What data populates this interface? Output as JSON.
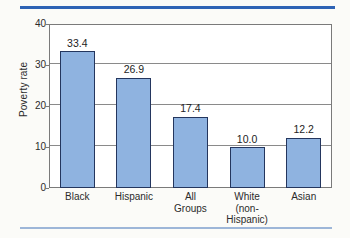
{
  "decor": {
    "top_rule_color": "#2e63b5",
    "bottom_rule_color": "#9db6d8"
  },
  "chart_data": {
    "type": "bar",
    "title": "",
    "xlabel": "",
    "ylabel": "Poverty rate",
    "categories": [
      "Black",
      "Hispanic",
      "All Groups",
      "White (non-Hispanic)",
      "Asian"
    ],
    "category_lines": [
      [
        "Black"
      ],
      [
        "Hispanic"
      ],
      [
        "All",
        "Groups"
      ],
      [
        "White",
        "(non-",
        "Hispanic)"
      ],
      [
        "Asian"
      ]
    ],
    "values": [
      33.4,
      26.9,
      17.4,
      10.0,
      12.2
    ],
    "value_labels": [
      "33.4",
      "26.9",
      "17.4",
      "10.0",
      "12.2"
    ],
    "ylim": [
      0,
      40
    ],
    "yticks": [
      0,
      10,
      20,
      30,
      40
    ],
    "ytick_labels": [
      "0",
      "10",
      "20",
      "30",
      "40"
    ],
    "grid": true,
    "grid_values": [
      10,
      20,
      30
    ],
    "legend": null,
    "bar_color": "#8fb3e0",
    "bar_border_color": "#24365e",
    "axis_color": "#7a7a7a",
    "plot_background": "#ffffff"
  }
}
